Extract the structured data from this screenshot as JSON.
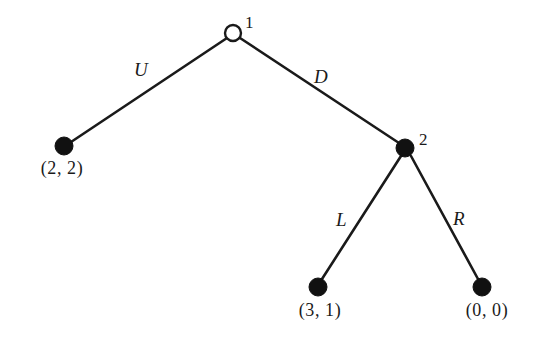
{
  "figure": {
    "kind": "extensive-form-game-tree",
    "background_color": "#ffffff",
    "line_color": "#1a1a1a",
    "node_fill_open": "#ffffff",
    "node_fill_closed": "#111111"
  },
  "nodes": {
    "root": {
      "id": "1",
      "type": "open-circle",
      "x": 233,
      "y": 33,
      "radius": 8,
      "label_x": 245,
      "label_y": 14
    },
    "second": {
      "id": "2",
      "type": "filled-circle",
      "x": 405,
      "y": 148,
      "radius": 9,
      "label_x": 419,
      "label_y": 131
    }
  },
  "terminals": [
    {
      "key": "terminal-uu",
      "payoff": "(2, 2)",
      "x": 64,
      "y": 146,
      "radius": 9,
      "text_x": 62,
      "text_y": 159
    },
    {
      "key": "terminal-dl",
      "payoff": "(3, 1)",
      "x": 318,
      "y": 287,
      "radius": 9,
      "text_x": 320,
      "text_y": 301
    },
    {
      "key": "terminal-dr",
      "payoff": "(0, 0)",
      "x": 482,
      "y": 287,
      "radius": 9,
      "text_x": 487,
      "text_y": 301
    }
  ],
  "branches": [
    {
      "key": "branch-u",
      "label": "U",
      "from": "root",
      "to": "terminal-uu",
      "x1": 227,
      "y1": 38,
      "x2": 71,
      "y2": 142,
      "label_x": 134,
      "label_y": 60
    },
    {
      "key": "branch-d",
      "label": "D",
      "from": "root",
      "to": "second",
      "x1": 240,
      "y1": 38,
      "x2": 399,
      "y2": 143,
      "label_x": 314,
      "label_y": 67
    },
    {
      "key": "branch-l",
      "label": "L",
      "from": "second",
      "to": "terminal-dl",
      "x1": 401,
      "y1": 156,
      "x2": 322,
      "y2": 279,
      "label_x": 336,
      "label_y": 210
    },
    {
      "key": "branch-r",
      "label": "R",
      "from": "second",
      "to": "terminal-dr",
      "x1": 411,
      "y1": 156,
      "x2": 478,
      "y2": 279,
      "label_x": 453,
      "label_y": 209
    }
  ]
}
